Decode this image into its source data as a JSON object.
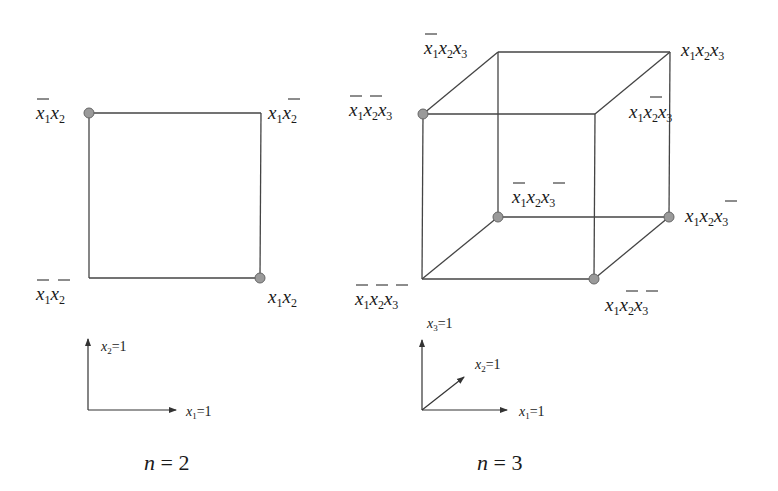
{
  "figure": {
    "panels": [
      {
        "id": "n2",
        "caption": "n = 2",
        "caption_var": "n",
        "caption_rest": " = 2",
        "shape": "square",
        "vertices": [
          {
            "id": "x1bar_x2",
            "label_parts": [
              {
                "v": "x",
                "s": "1",
                "bar": true
              },
              {
                "v": "x",
                "s": "2",
                "bar": false
              }
            ],
            "highlighted": true
          },
          {
            "id": "x1_x2bar",
            "label_parts": [
              {
                "v": "x",
                "s": "1",
                "bar": false
              },
              {
                "v": "x",
                "s": "2",
                "bar": true
              }
            ],
            "highlighted": false
          },
          {
            "id": "x1bar_x2bar",
            "label_parts": [
              {
                "v": "x",
                "s": "1",
                "bar": true
              },
              {
                "v": "x",
                "s": "2",
                "bar": true
              }
            ],
            "highlighted": false
          },
          {
            "id": "x1_x2",
            "label_parts": [
              {
                "v": "x",
                "s": "1",
                "bar": false
              },
              {
                "v": "x",
                "s": "2",
                "bar": false
              }
            ],
            "highlighted": true
          }
        ],
        "axes": [
          {
            "label_var": "x",
            "label_sub": "2",
            "label_rest": "=1",
            "direction": "up"
          },
          {
            "label_var": "x",
            "label_sub": "1",
            "label_rest": "=1",
            "direction": "right"
          }
        ]
      },
      {
        "id": "n3",
        "caption": "n = 3",
        "caption_var": "n",
        "caption_rest": " = 3",
        "shape": "cube",
        "vertices": [
          {
            "id": "x1bar_x2_x3",
            "label": "x̄1x2x3",
            "highlighted": false
          },
          {
            "id": "x1_x2_x3",
            "label": "x1x2x3",
            "highlighted": false
          },
          {
            "id": "x1bar_x2bar_x3",
            "label": "x̄1x̄2x3",
            "highlighted": true
          },
          {
            "id": "x1_x2bar_x3",
            "label": "x1x̄2x3",
            "highlighted": false
          },
          {
            "id": "x1bar_x2_x3bar",
            "label": "x̄1x2x̄3",
            "highlighted": true
          },
          {
            "id": "x1_x2_x3bar",
            "label": "x1x2x̄3",
            "highlighted": true
          },
          {
            "id": "x1bar_x2bar_x3bar",
            "label": "x̄1x̄2x̄3",
            "highlighted": false
          },
          {
            "id": "x1_x2bar_x3bar",
            "label": "x1x̄2x̄3",
            "highlighted": true
          }
        ],
        "axes": [
          {
            "label_var": "x",
            "label_sub": "3",
            "label_rest": "=1",
            "direction": "up"
          },
          {
            "label_var": "x",
            "label_sub": "2",
            "label_rest": "=1",
            "direction": "diagonal"
          },
          {
            "label_var": "x",
            "label_sub": "1",
            "label_rest": "=1",
            "direction": "right"
          }
        ]
      }
    ],
    "colors": {
      "line": "#444444",
      "dot_fill": "#9a9a9a",
      "dot_stroke": "#666666",
      "text": "#1a1a1a"
    }
  }
}
